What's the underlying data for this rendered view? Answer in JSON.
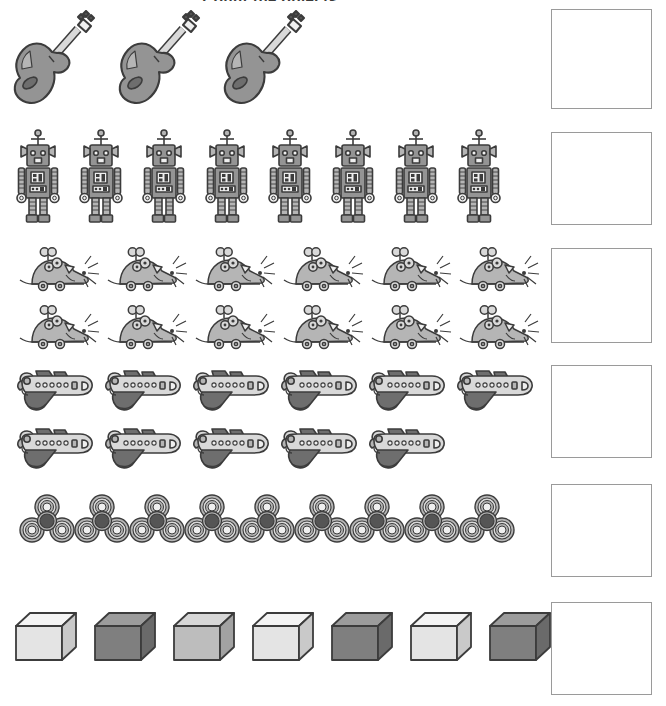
{
  "worksheet": {
    "title": "Count the objects",
    "page_background": "#ffffff",
    "box_border_color": "#9a9a9a",
    "ink_color": "#3a3a3a"
  },
  "palette": {
    "outline": "#3c3c3c",
    "light": "#efefef",
    "light_mid": "#d9d9d9",
    "mid": "#b5b5b5",
    "mid_dark": "#949494",
    "dark": "#6e6e6e",
    "darker": "#555555"
  },
  "rows": [
    {
      "id": "row-guitars",
      "object_name": "guitar",
      "object_label": "Guitars",
      "count": 3,
      "lines": [
        3
      ],
      "answer": ""
    },
    {
      "id": "row-robots",
      "object_name": "robot",
      "object_label": "Robots",
      "count": 8,
      "lines": [
        8
      ],
      "answer": ""
    },
    {
      "id": "row-mice",
      "object_name": "wind-up-mouse",
      "object_label": "Toy mice",
      "count": 12,
      "lines": [
        6,
        6
      ],
      "answer": ""
    },
    {
      "id": "row-planes",
      "object_name": "airplane",
      "object_label": "Airplanes",
      "count": 11,
      "lines": [
        6,
        5
      ],
      "answer": ""
    },
    {
      "id": "row-spinners",
      "object_name": "fidget-spinner",
      "object_label": "Fidget spinners",
      "count": 9,
      "lines": [
        9
      ],
      "answer": ""
    },
    {
      "id": "row-cubes",
      "object_name": "cube",
      "object_label": "Cubes",
      "count": 7,
      "lines": [
        7
      ],
      "answer": "",
      "shades": [
        "light",
        "dark",
        "mid",
        "light",
        "dark",
        "light",
        "dark"
      ]
    }
  ],
  "answer_boxes": [
    {
      "row": "row-guitars",
      "value": ""
    },
    {
      "row": "row-robots",
      "value": ""
    },
    {
      "row": "row-mice",
      "value": ""
    },
    {
      "row": "row-planes",
      "value": ""
    },
    {
      "row": "row-spinners",
      "value": ""
    },
    {
      "row": "row-cubes",
      "value": ""
    }
  ]
}
